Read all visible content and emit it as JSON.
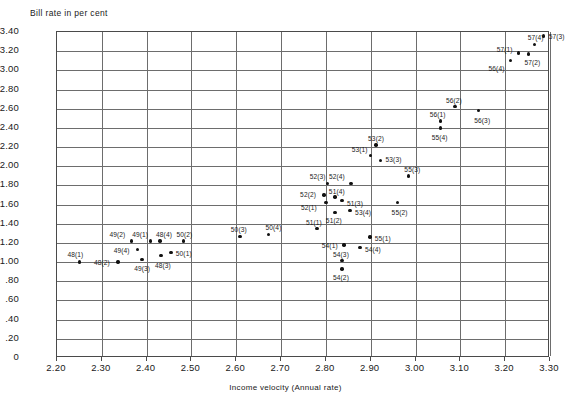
{
  "chart_data": {
    "type": "scatter",
    "title": "",
    "ylabel": "Bill rate in per cent",
    "xlabel": "Income velocity (Annual rate)",
    "xlim": [
      2.2,
      3.3
    ],
    "ylim": [
      0,
      3.4
    ],
    "xticks": [
      "2.20",
      "2.30",
      "2.40",
      "2.50",
      "2.60",
      "2.70",
      "2.80",
      "2.90",
      "3.00",
      "3.10",
      "3.20",
      "3.30"
    ],
    "xtick_values": [
      2.2,
      2.3,
      2.4,
      2.5,
      2.6,
      2.7,
      2.8,
      2.9,
      3.0,
      3.1,
      3.2,
      3.3
    ],
    "yticks": [
      "3.40",
      "3.20",
      "3.00",
      "2.80",
      "2.60",
      "2.40",
      "2.20",
      "2.00",
      "1.80",
      "1.60",
      "1.40",
      "1.20",
      "1.00",
      ".80",
      ".60",
      ".40",
      ".20",
      "0"
    ],
    "ytick_values": [
      3.4,
      3.2,
      3.0,
      2.8,
      2.6,
      2.4,
      2.2,
      2.0,
      1.8,
      1.6,
      1.4,
      1.2,
      1.0,
      0.8,
      0.6,
      0.4,
      0.2,
      0
    ],
    "grid": true,
    "legend": "none",
    "points": [
      {
        "label": "48(1)",
        "x": 2.25,
        "y": 1.0,
        "lx": -12,
        "ly": -11
      },
      {
        "label": "48(2)",
        "x": 2.336,
        "y": 1.0,
        "lx": -24,
        "ly": -3
      },
      {
        "label": "48(3)",
        "x": 2.432,
        "y": 1.07,
        "lx": -6,
        "ly": 7
      },
      {
        "label": "48(4)",
        "x": 2.43,
        "y": 1.22,
        "lx": -4,
        "ly": -10
      },
      {
        "label": "49(1)",
        "x": 2.408,
        "y": 1.22,
        "lx": -18,
        "ly": -10
      },
      {
        "label": "49(2)",
        "x": 2.366,
        "y": 1.22,
        "lx": -22,
        "ly": -10
      },
      {
        "label": "49(3)",
        "x": 2.39,
        "y": 1.03,
        "lx": -8,
        "ly": 6
      },
      {
        "label": "49(4)",
        "x": 2.38,
        "y": 1.13,
        "lx": -24,
        "ly": -3
      },
      {
        "label": "50(1)",
        "x": 2.454,
        "y": 1.1,
        "lx": 5,
        "ly": -3
      },
      {
        "label": "50(2)",
        "x": 2.482,
        "y": 1.22,
        "lx": -7,
        "ly": -10
      },
      {
        "label": "50(3)",
        "x": 2.608,
        "y": 1.27,
        "lx": -9,
        "ly": -10
      },
      {
        "label": "50(4)",
        "x": 2.672,
        "y": 1.29,
        "lx": -3,
        "ly": -10
      },
      {
        "label": "51(1)",
        "x": 2.78,
        "y": 1.35,
        "lx": -11,
        "ly": -10
      },
      {
        "label": "51(2)",
        "x": 2.82,
        "y": 1.52,
        "lx": -9,
        "ly": 5
      },
      {
        "label": "51(3)",
        "x": 2.836,
        "y": 1.64,
        "lx": 5,
        "ly": -1
      },
      {
        "label": "51(4)",
        "x": 2.82,
        "y": 1.68,
        "lx": -6,
        "ly": -9
      },
      {
        "label": "52(1)",
        "x": 2.8,
        "y": 1.62,
        "lx": -25,
        "ly": 1
      },
      {
        "label": "52(2)",
        "x": 2.796,
        "y": 1.7,
        "lx": -24,
        "ly": -4
      },
      {
        "label": "52(3)",
        "x": 2.804,
        "y": 1.82,
        "lx": -18,
        "ly": -10
      },
      {
        "label": "52(4)",
        "x": 2.856,
        "y": 1.82,
        "lx": -22,
        "ly": -10
      },
      {
        "label": "53(1)",
        "x": 2.9,
        "y": 2.11,
        "lx": -19,
        "ly": -10
      },
      {
        "label": "53(2)",
        "x": 2.912,
        "y": 2.22,
        "lx": -8,
        "ly": -10
      },
      {
        "label": "53(3)",
        "x": 2.922,
        "y": 2.06,
        "lx": 5,
        "ly": 0
      },
      {
        "label": "53(4)",
        "x": 2.854,
        "y": 1.54,
        "lx": 5,
        "ly": -1
      },
      {
        "label": "54(1)",
        "x": 2.84,
        "y": 1.18,
        "lx": -22,
        "ly": -3
      },
      {
        "label": "54(2)",
        "x": 2.836,
        "y": 0.93,
        "lx": -9,
        "ly": 5
      },
      {
        "label": "54(3)",
        "x": 2.836,
        "y": 1.02,
        "lx": -9,
        "ly": -9
      },
      {
        "label": "54(4)",
        "x": 2.876,
        "y": 1.15,
        "lx": 5,
        "ly": -2
      },
      {
        "label": "55(1)",
        "x": 2.898,
        "y": 1.26,
        "lx": 5,
        "ly": -2
      },
      {
        "label": "55(2)",
        "x": 2.96,
        "y": 1.62,
        "lx": -6,
        "ly": 6
      },
      {
        "label": "55(3)",
        "x": 2.984,
        "y": 1.9,
        "lx": -4,
        "ly": -10
      },
      {
        "label": "55(4)",
        "x": 3.056,
        "y": 2.4,
        "lx": -9,
        "ly": 6
      },
      {
        "label": "56(1)",
        "x": 3.056,
        "y": 2.47,
        "lx": -11,
        "ly": -10
      },
      {
        "label": "56(2)",
        "x": 3.088,
        "y": 2.62,
        "lx": -9,
        "ly": -10
      },
      {
        "label": "56(3)",
        "x": 3.14,
        "y": 2.58,
        "lx": -4,
        "ly": 6
      },
      {
        "label": "56(4)",
        "x": 3.212,
        "y": 3.1,
        "lx": -22,
        "ly": 4
      },
      {
        "label": "57(1)",
        "x": 3.23,
        "y": 3.18,
        "lx": -22,
        "ly": -7
      },
      {
        "label": "57(2)",
        "x": 3.252,
        "y": 3.17,
        "lx": -4,
        "ly": 5
      },
      {
        "label": "57(3)",
        "x": 3.286,
        "y": 3.36,
        "lx": 5,
        "ly": -3
      },
      {
        "label": "57(4)",
        "x": 3.266,
        "y": 3.27,
        "lx": -7,
        "ly": -10
      }
    ]
  }
}
